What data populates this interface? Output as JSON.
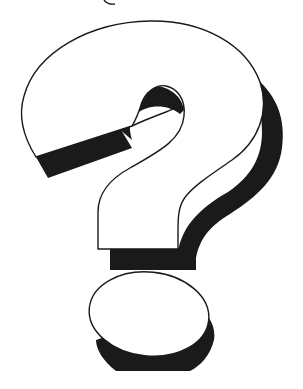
{
  "image": {
    "subject": "question-mark clip art",
    "description": "White outlined question mark with black drop shadow",
    "colors": {
      "background": "#ffffff",
      "fill": "#ffffff",
      "outline": "#1a1a1a",
      "shadow": "#1a1a1a"
    }
  }
}
